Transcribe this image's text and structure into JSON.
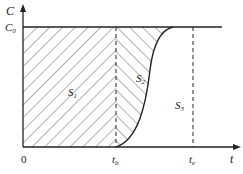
{
  "diagram": {
    "type": "breakthrough-curve",
    "axes": {
      "y_label": "C",
      "x_label": "t",
      "origin_label": "0",
      "y_tick": {
        "label": "C",
        "subscript": "0"
      },
      "x_ticks": [
        {
          "label": "t",
          "subscript": "b"
        },
        {
          "label": "t",
          "subscript": "e"
        }
      ]
    },
    "regions": [
      {
        "label": "S",
        "subscript": "1",
        "hatch": "forward-diagonal"
      },
      {
        "label": "S",
        "subscript": "2",
        "hatch": "backward-diagonal"
      },
      {
        "label": "S",
        "subscript": "3",
        "hatch": "none"
      }
    ],
    "colors": {
      "line": "#222222",
      "hatch": "#555555",
      "background": "#ffffff"
    }
  }
}
